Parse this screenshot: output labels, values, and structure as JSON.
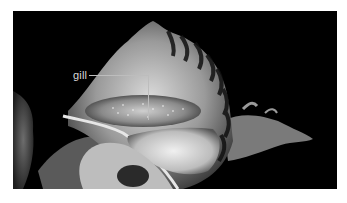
{
  "figure": {
    "background_color": "#000000",
    "annotations": [
      {
        "label": "gill",
        "target": "gill"
      }
    ]
  }
}
